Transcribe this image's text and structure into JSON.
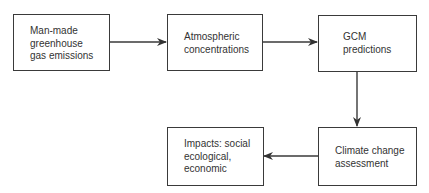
{
  "diagram": {
    "type": "flowchart",
    "nodes": [
      {
        "id": "emissions",
        "label": "Man-made\ngreenhouse\ngas emissions"
      },
      {
        "id": "concentrations",
        "label": "Atmospheric\nconcentrations"
      },
      {
        "id": "gcm",
        "label": "GCM\npredictions"
      },
      {
        "id": "impacts",
        "label": "Impacts: social\necological,\neconomic"
      },
      {
        "id": "assessment",
        "label": "Climate change\nassessment"
      }
    ],
    "edges": [
      {
        "from": "emissions",
        "to": "concentrations"
      },
      {
        "from": "concentrations",
        "to": "gcm"
      },
      {
        "from": "gcm",
        "to": "assessment"
      },
      {
        "from": "assessment",
        "to": "impacts"
      }
    ],
    "colors": {
      "stroke": "#3a3a3a",
      "text": "#333333",
      "background": "#ffffff"
    }
  }
}
